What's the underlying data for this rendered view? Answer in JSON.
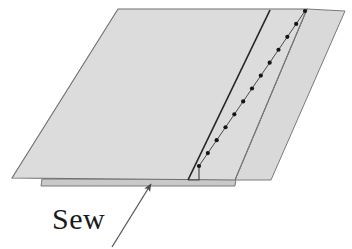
{
  "figure": {
    "type": "technical-illustration",
    "background_color": "#ffffff"
  },
  "labels": {
    "sew": "Sew"
  },
  "colors": {
    "fabric_fill_main": "#dcdcdc",
    "fabric_fill_flap": "#d9d9d9",
    "fabric_fill_underlayer": "#c9c9c9",
    "outline": "#6e6e6e",
    "seam_line": "#262626",
    "stitch_line": "#3a3a3a",
    "stitch_dot": "#161616",
    "arrow": "#555555",
    "text": "#1b1b1b"
  },
  "shapes": {
    "main_panel": {
      "name": "fabric-main-panel",
      "points": "118,9 307,9 235,180 12,178"
    },
    "upper_flap": {
      "name": "fabric-upper-flap",
      "points": "307,9 345,11 271,180 235,180"
    },
    "under_layer_strip": {
      "name": "fabric-under-layer-strip",
      "points": "42,179 236,179 235,186 41,186"
    },
    "seam_line": {
      "name": "seam-fold-line",
      "x1": 270,
      "y1": 10,
      "x2": 188,
      "y2": 180
    },
    "flap_edge_line": {
      "name": "flap-edge-line",
      "x1": 307,
      "y1": 9,
      "x2": 235,
      "y2": 180
    },
    "stitch_line": {
      "name": "stitch-dotted-line",
      "x1": 305,
      "y1": 11,
      "x2": 199,
      "y2": 166,
      "dot_count": 13,
      "dot_radius": 2.1
    },
    "stitch_step": {
      "name": "stitch-step-notch",
      "points": "199,166 199,180 188,180"
    },
    "arrow": {
      "name": "sew-pointer-arrow",
      "tail_x": 112,
      "tail_y": 247,
      "tip_x": 151,
      "tip_y": 183
    }
  }
}
